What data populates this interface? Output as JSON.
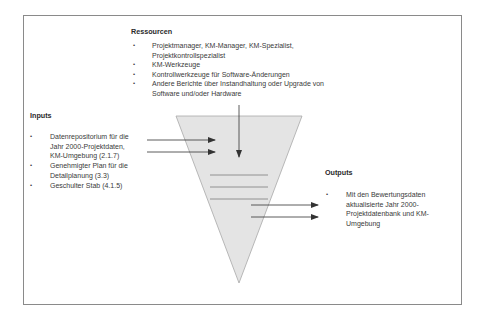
{
  "ressourcen": {
    "title": "Ressourcen",
    "items": [
      {
        "lines": [
          "Projektmanager, KM-Manager, KM-Spezialist,",
          "Projektkontrollspezialist"
        ]
      },
      {
        "lines": [
          "KM-Werkzeuge"
        ]
      },
      {
        "lines": [
          "Kontrollwerkzeuge für Software-Änderungen"
        ]
      },
      {
        "lines": [
          "Andere Berichte über Instandhaltung oder Upgrade von",
          "Software und/oder Hardware"
        ]
      }
    ]
  },
  "inputs": {
    "title": "Inputs",
    "items": [
      {
        "lines": [
          "Datenrepositorium für die",
          "Jahr 2000-Projektdaten,",
          "KM-Umgebung (2.1.7)"
        ]
      },
      {
        "lines": [
          "Genehmigter Plan für die",
          "Detailplanung (3.3)"
        ]
      },
      {
        "lines": [
          "Geschulter Stab (4.1.5)"
        ]
      }
    ]
  },
  "outputs": {
    "title": "Outputs",
    "items": [
      {
        "lines": [
          "Mit den Bewertungsdaten",
          "aktualisierte Jahr 2000-",
          "Projektdatenbank und KM-",
          "Umgebung"
        ]
      }
    ]
  },
  "bullet_char": "•",
  "colors": {
    "funnel_fill": "#e4e4e4",
    "funnel_stroke": "#a8a8a8",
    "arrow": "#333333",
    "frame": "#8a8a8a"
  }
}
